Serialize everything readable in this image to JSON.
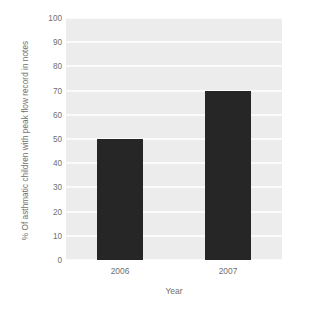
{
  "chart_data": {
    "type": "bar",
    "title": "",
    "subtitle": "",
    "categories": [
      "2006",
      "2007"
    ],
    "values": [
      50,
      70
    ],
    "series": [
      {
        "name": "% Of asthmatic children with peak flow record in notes",
        "values": [
          50,
          70
        ]
      }
    ],
    "xlabel": "Year",
    "ylabel": "% Of asthmatic children with peak flow record in notes",
    "ylim": [
      0,
      100
    ],
    "ytick_values": [
      0,
      10,
      20,
      30,
      40,
      50,
      60,
      70,
      80,
      90,
      100
    ],
    "ytick_labels": [
      "0",
      "10",
      "20",
      "30",
      "40",
      "50",
      "60",
      "70",
      "80",
      "90",
      "100"
    ],
    "xtick_labels": [
      "2006",
      "2007"
    ],
    "grid": "horizontal",
    "legend": "none",
    "annotations": [],
    "colors": {
      "bar": "#262626",
      "plot_background": "#ececec",
      "gridline": "#fbfbfb",
      "page_background": "#ffffff",
      "text": "#6f6f6f"
    }
  }
}
